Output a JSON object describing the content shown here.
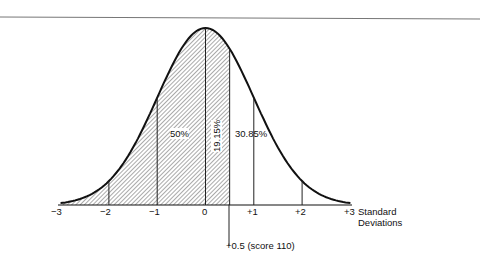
{
  "figure": {
    "title": "",
    "percent_labels": {
      "left_half": "50%",
      "zero_to_half": "19.15%",
      "right_tail": "30.85%"
    },
    "ticks": [
      "−3",
      "−2",
      "−1",
      "0",
      "+1",
      "+2",
      "+3"
    ],
    "axis_label_line1": "Standard",
    "axis_label_line2": "Deviations",
    "marker_label": "+0.5 (score 110)"
  },
  "chart_data": {
    "type": "area",
    "xlabel": "Standard Deviations",
    "x_ticks": [
      -3,
      -2,
      -1,
      0,
      1,
      2,
      3
    ],
    "shaded_range": [
      -3,
      0.5
    ],
    "marker": {
      "x": 0.5,
      "label": "+0.5 (score 110)"
    },
    "regions": [
      {
        "range": [
          -3,
          0
        ],
        "label": "50%"
      },
      {
        "range": [
          0,
          0.5
        ],
        "label": "19.15%"
      },
      {
        "range": [
          0.5,
          3
        ],
        "label": "30.85%"
      }
    ]
  }
}
